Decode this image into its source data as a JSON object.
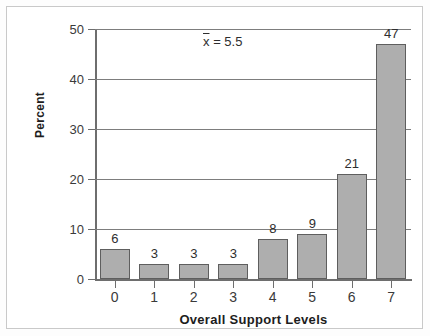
{
  "chart_data": {
    "type": "bar",
    "title": "",
    "subtitle": "",
    "categories": [
      "0",
      "1",
      "2",
      "3",
      "4",
      "5",
      "6",
      "7"
    ],
    "values": [
      6,
      3,
      3,
      3,
      8,
      9,
      21,
      47
    ],
    "data_labels": [
      "6",
      "3",
      "3",
      "3",
      "8",
      "9",
      "21",
      "47"
    ],
    "xlabel": "Overall Support Levels",
    "ylabel": "Percent",
    "ylim": [
      0,
      50
    ],
    "yticks": [
      0,
      10,
      20,
      30,
      40,
      50
    ],
    "ytick_labels": [
      "0",
      "10",
      "20",
      "30",
      "40",
      "50"
    ],
    "xtick_labels": [
      "0",
      "1",
      "2",
      "3",
      "4",
      "5",
      "6",
      "7"
    ],
    "grid": "horizontal",
    "legend": "none",
    "annotations": [
      {
        "symbol": "x",
        "operator": "=",
        "value": "5.5",
        "text": "x̄ = 5.5"
      }
    ],
    "colors": {
      "bar_fill": "#aeaeae",
      "bar_stroke": "#5e5e5e",
      "gridline": "#7d7d7d",
      "axis": "#6e6e6e",
      "text": "#2e2e2e",
      "frame": "#c9c9c9",
      "background": "#ffffff"
    }
  }
}
